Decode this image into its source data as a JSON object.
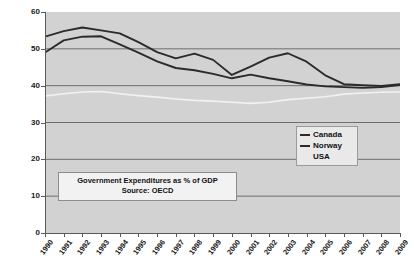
{
  "chart_data": {
    "type": "line",
    "title": "",
    "xlabel": "",
    "ylabel": "",
    "ylim": [
      0,
      60
    ],
    "ytick_values": [
      60,
      50,
      40,
      30,
      20,
      10,
      0
    ],
    "ytick_labels": [
      "60",
      "50",
      "40",
      "30",
      "20",
      "10",
      "0"
    ],
    "grid": true,
    "grid_axis": "y",
    "legend_position": "middle-right",
    "categories": [
      "1990",
      "1991",
      "1992",
      "1993",
      "1994",
      "1995",
      "1996",
      "1997",
      "1998",
      "1999",
      "2000",
      "2001",
      "2002",
      "2003",
      "2004",
      "2005",
      "2006",
      "2007",
      "2008",
      "2009"
    ],
    "series": [
      {
        "name": "Canada",
        "color": "#2b2b2b",
        "values": [
          49.0,
          52.3,
          53.3,
          53.4,
          51.2,
          49.0,
          46.6,
          44.8,
          44.2,
          43.2,
          42.0,
          43.0,
          42.0,
          41.2,
          40.3,
          39.8,
          39.6,
          39.4,
          39.6,
          40.2
        ]
      },
      {
        "name": "Norway",
        "color": "#2b2b2b",
        "values": [
          53.3,
          54.8,
          55.8,
          55.0,
          54.2,
          51.8,
          49.1,
          47.4,
          48.7,
          47.0,
          42.9,
          45.2,
          47.6,
          48.8,
          46.5,
          42.8,
          40.4,
          40.1,
          39.9,
          40.4
        ]
      },
      {
        "name": "USA",
        "color": "#f2f2f2",
        "values": [
          37.2,
          37.8,
          38.3,
          38.4,
          37.8,
          37.3,
          36.9,
          36.4,
          36.0,
          35.8,
          35.5,
          35.2,
          35.5,
          36.2,
          36.6,
          37.0,
          37.7,
          38.0,
          38.2,
          38.3
        ]
      }
    ],
    "annotation": {
      "line1": "Government Expenditures as  % of GDP",
      "line2": "Source: OECD"
    },
    "legend_entries": [
      {
        "label": "Canada",
        "swatch": "line"
      },
      {
        "label": "Norway",
        "swatch": "line"
      },
      {
        "label": "USA",
        "swatch": "none"
      }
    ],
    "colors": {
      "plot_background": "#d2d2d2",
      "gridline": "#6e6e6e",
      "axis": "#5a5a5a",
      "page_background": "#ffffff"
    }
  }
}
